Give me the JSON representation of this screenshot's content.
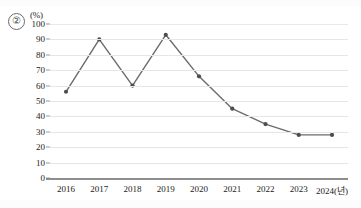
{
  "figure": {
    "item_number": "②",
    "unit_label": "(%)"
  },
  "chart_data": {
    "type": "line",
    "title": "",
    "xlabel": "2024(년)",
    "ylabel": "(%)",
    "categories": [
      "2016",
      "2017",
      "2018",
      "2019",
      "2020",
      "2021",
      "2022",
      "2023",
      "2024"
    ],
    "x_tick_labels": [
      "2016",
      "2017",
      "2018",
      "2019",
      "2020",
      "2021",
      "2022",
      "2023",
      "2024(년)"
    ],
    "values": [
      56,
      90,
      60,
      93,
      66,
      45,
      35,
      28,
      28
    ],
    "series": [
      {
        "name": "",
        "values": [
          56,
          90,
          60,
          93,
          66,
          45,
          35,
          28,
          28
        ]
      }
    ],
    "ylim": [
      0,
      100
    ],
    "y_tick_labels": [
      "0",
      "10",
      "20",
      "30",
      "40",
      "50",
      "60",
      "70",
      "80",
      "90",
      "100"
    ],
    "y_ticks": [
      0,
      10,
      20,
      30,
      40,
      50,
      60,
      70,
      80,
      90,
      100
    ],
    "grid": true,
    "grid_axis": "y",
    "legend": false,
    "legend_position": "none",
    "marker": "circle",
    "line_color": "#6b6b6b",
    "marker_color": "#4d4d4d",
    "grid_color": "#e6e6e6",
    "axis_color": "#8e8e8e"
  }
}
